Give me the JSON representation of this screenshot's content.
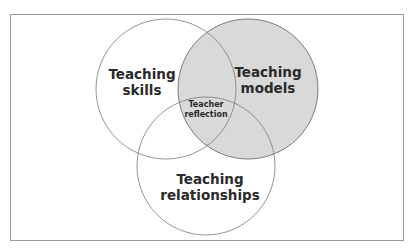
{
  "diagram": {
    "type": "venn",
    "colors": {
      "frame_border": "#9a9a9a",
      "circle_stroke": "#6e6e6e",
      "shaded_fill": "#d9d9d9",
      "text": "#2a2a2a",
      "background": "#ffffff"
    },
    "circles": [
      {
        "id": "teaching-skills",
        "lines": [
          "Teaching",
          "skills"
        ],
        "shaded": false
      },
      {
        "id": "teaching-models",
        "lines": [
          "Teaching",
          "models"
        ],
        "shaded": true
      },
      {
        "id": "teaching-relationships",
        "lines": [
          "Teaching",
          "relationships"
        ],
        "shaded": false
      }
    ],
    "center": {
      "lines": [
        "Teacher",
        "reflection"
      ]
    }
  }
}
